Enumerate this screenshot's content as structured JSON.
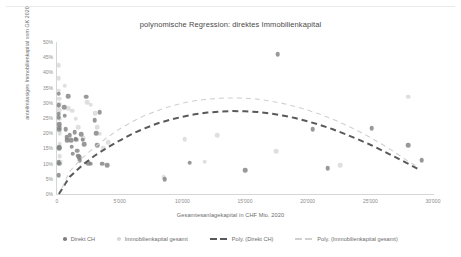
{
  "chart_data": {
    "type": "scatter",
    "title": "polynomische Regression: direktes Immobilienkapital",
    "xlabel": "Gesamtesanlagekapital in CHF Mio.  2020",
    "ylabel": "anteilmässiges Immobilienkapital vom GK 2020",
    "xlim": [
      0,
      30000
    ],
    "ylim": [
      0,
      0.5
    ],
    "grid": false,
    "legend_position": "bottom",
    "xticks": [
      "0",
      "5'000",
      "10'000",
      "15'000",
      "20'000",
      "25'000",
      "30'000"
    ],
    "xtick_values": [
      0,
      5000,
      10000,
      15000,
      20000,
      25000,
      30000
    ],
    "yticks": [
      "0%",
      "5%",
      "10%",
      "15%",
      "20%",
      "25%",
      "30%",
      "35%",
      "40%",
      "45%",
      "50%"
    ],
    "ytick_values": [
      0,
      5,
      10,
      15,
      20,
      25,
      30,
      35,
      40,
      45,
      50
    ],
    "colors": {
      "direkt_ch": "#808080",
      "immobilienkapital_gesamt": "#d9d9d9",
      "poly_direkt_ch": "#595959",
      "poly_immobilienkapital_gesamt": "#d0d0d0"
    },
    "series": [
      {
        "name": "Direkt CH",
        "type": "scatter",
        "color": "#808080",
        "points": [
          [
            120,
            33.0
          ],
          [
            140,
            29.2
          ],
          [
            150,
            26.4
          ],
          [
            150,
            25.2
          ],
          [
            160,
            23.0
          ],
          [
            170,
            21.8
          ],
          [
            180,
            21.2
          ],
          [
            160,
            15.3
          ],
          [
            170,
            15.0
          ],
          [
            150,
            10.4
          ],
          [
            155,
            10.0
          ],
          [
            150,
            6.2
          ],
          [
            560,
            28.6
          ],
          [
            620,
            25.8
          ],
          [
            700,
            21.4
          ],
          [
            760,
            18.6
          ],
          [
            800,
            17.6
          ],
          [
            900,
            32.2
          ],
          [
            1000,
            19.4
          ],
          [
            1150,
            17.6
          ],
          [
            1180,
            15.6
          ],
          [
            1250,
            13.2
          ],
          [
            1400,
            20.3
          ],
          [
            1500,
            18.2
          ],
          [
            1550,
            17.8
          ],
          [
            1600,
            14.2
          ],
          [
            1700,
            12.6
          ],
          [
            1750,
            12.2
          ],
          [
            1800,
            11.2
          ],
          [
            1950,
            19.6
          ],
          [
            2050,
            17.8
          ],
          [
            2150,
            16.4
          ],
          [
            2350,
            32.0
          ],
          [
            2500,
            10.2
          ],
          [
            2700,
            10.0
          ],
          [
            3000,
            24.2
          ],
          [
            3150,
            20.0
          ],
          [
            3200,
            16.0
          ],
          [
            3400,
            27.0
          ],
          [
            3600,
            10.0
          ],
          [
            4000,
            9.4
          ],
          [
            8600,
            4.8
          ],
          [
            10600,
            10.3
          ],
          [
            15000,
            7.8
          ],
          [
            17600,
            46.0
          ],
          [
            20400,
            21.4
          ],
          [
            21600,
            8.4
          ],
          [
            25100,
            21.6
          ],
          [
            28000,
            16.0
          ],
          [
            29100,
            11.2
          ]
        ]
      },
      {
        "name": "Immobilienkapital gesamt",
        "type": "scatter",
        "color": "#d9d9d9",
        "points": [
          [
            130,
            42.4
          ],
          [
            140,
            38.0
          ],
          [
            150,
            34.0
          ],
          [
            160,
            31.4
          ],
          [
            170,
            29.6
          ],
          [
            180,
            27.6
          ],
          [
            190,
            24.8
          ],
          [
            200,
            22.6
          ],
          [
            210,
            20.0
          ],
          [
            220,
            16.6
          ],
          [
            230,
            12.4
          ],
          [
            240,
            10.4
          ],
          [
            620,
            35.6
          ],
          [
            900,
            28.2
          ],
          [
            1200,
            27.4
          ],
          [
            1500,
            24.8
          ],
          [
            1700,
            22.0
          ],
          [
            2100,
            18.4
          ],
          [
            2400,
            30.2
          ],
          [
            2700,
            29.4
          ],
          [
            3050,
            26.6
          ],
          [
            3200,
            22.0
          ],
          [
            3400,
            19.8
          ],
          [
            3700,
            15.0
          ],
          [
            4100,
            17.0
          ],
          [
            8500,
            5.6
          ],
          [
            10200,
            18.0
          ],
          [
            11800,
            10.6
          ],
          [
            12800,
            19.4
          ],
          [
            17500,
            14.0
          ],
          [
            22600,
            9.4
          ],
          [
            28000,
            32.0
          ]
        ]
      }
    ],
    "trendlines": [
      {
        "name": "Poly. (Direkt CH)",
        "color": "#595959",
        "dash": "dark-dashed",
        "coefficients_note": "quadratic peak ~27% at ~15'500",
        "points": [
          [
            150,
            0.0
          ],
          [
            1000,
            5.6
          ],
          [
            2000,
            9.4
          ],
          [
            3000,
            12.6
          ],
          [
            4000,
            15.2
          ],
          [
            5000,
            17.6
          ],
          [
            6000,
            19.8
          ],
          [
            7000,
            21.6
          ],
          [
            8000,
            23.2
          ],
          [
            9000,
            24.4
          ],
          [
            10000,
            25.4
          ],
          [
            11000,
            26.2
          ],
          [
            12000,
            26.8
          ],
          [
            13000,
            27.1
          ],
          [
            14000,
            27.3
          ],
          [
            15000,
            27.2
          ],
          [
            16000,
            27.0
          ],
          [
            17000,
            26.5
          ],
          [
            18000,
            25.8
          ],
          [
            19000,
            25.0
          ],
          [
            20000,
            23.9
          ],
          [
            21000,
            22.7
          ],
          [
            22000,
            21.3
          ],
          [
            23000,
            19.7
          ],
          [
            24000,
            18.0
          ],
          [
            25000,
            16.2
          ],
          [
            26000,
            14.2
          ],
          [
            27000,
            12.1
          ],
          [
            28000,
            10.0
          ],
          [
            29000,
            7.8
          ]
        ]
      },
      {
        "name": "Poly. (Immobilienkapital gesamt)",
        "color": "#d0d0d0",
        "dash": "light-dashed",
        "coefficients_note": "quadratic peak ~31.5% at ~14'500",
        "points": [
          [
            400,
            2.0
          ],
          [
            1000,
            7.4
          ],
          [
            2000,
            11.8
          ],
          [
            3000,
            15.4
          ],
          [
            4000,
            18.6
          ],
          [
            5000,
            21.4
          ],
          [
            6000,
            23.8
          ],
          [
            7000,
            25.8
          ],
          [
            8000,
            27.4
          ],
          [
            9000,
            28.8
          ],
          [
            10000,
            29.9
          ],
          [
            11000,
            30.7
          ],
          [
            12000,
            31.2
          ],
          [
            13000,
            31.5
          ],
          [
            14000,
            31.6
          ],
          [
            15000,
            31.5
          ],
          [
            16000,
            31.2
          ],
          [
            17000,
            30.6
          ],
          [
            18000,
            29.8
          ],
          [
            19000,
            28.8
          ],
          [
            20000,
            27.6
          ],
          [
            21000,
            26.2
          ],
          [
            22000,
            24.6
          ],
          [
            23000,
            22.8
          ],
          [
            24000,
            20.8
          ],
          [
            25000,
            18.6
          ],
          [
            26000,
            16.2
          ],
          [
            27000,
            13.6
          ],
          [
            28000,
            10.8
          ],
          [
            28600,
            9.4
          ]
        ]
      }
    ]
  },
  "legend": {
    "items": [
      {
        "label": "Direkt CH",
        "marker": "dot",
        "color": "#808080"
      },
      {
        "label": "Immobilienkapital gesamt",
        "marker": "dot",
        "color": "#d9d9d9"
      },
      {
        "label": "Poly. (Direkt CH)",
        "marker": "dash",
        "color": "#595959"
      },
      {
        "label": "Poly. (Immobilienkapital gesamt)",
        "marker": "dash-thin",
        "color": "#d0d0d0"
      }
    ]
  }
}
